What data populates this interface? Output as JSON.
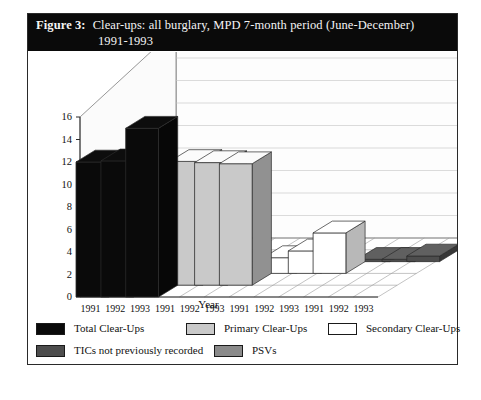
{
  "figure": {
    "label": "Figure 3:",
    "title_line1": "Clear-ups: all burglary, MPD 7-month period (June-December)",
    "title_line2": "1991-1993"
  },
  "chart_data": {
    "type": "bar",
    "title": "Number of Clear-Ups (Thousands)",
    "xlabel": "Year",
    "ylabel": "Number of Clear-Ups (Thousands)",
    "ylim": [
      0,
      16
    ],
    "yticks": [
      0,
      2,
      4,
      6,
      8,
      10,
      12,
      14,
      16
    ],
    "categories": [
      "1991",
      "1992",
      "1993"
    ],
    "xtick_labels": [
      "1991",
      "1992",
      "1993",
      "1991",
      "1992",
      "1993",
      "1991",
      "1992",
      "1993",
      "1991",
      "1992",
      "1993"
    ],
    "grid": true,
    "legend_position": "below",
    "projection": "3d-columns",
    "series": [
      {
        "name": "Total Clear-Ups",
        "color": "#0a0a0a",
        "values": [
          12.0,
          12.1,
          15.0
        ]
      },
      {
        "name": "Primary Clear-Ups",
        "color": "#c9c9c9",
        "values": [
          11.0,
          10.9,
          10.8
        ]
      },
      {
        "name": "Secondary Clear-Ups",
        "color": "#ffffff",
        "values": [
          1.4,
          2.0,
          3.6
        ]
      },
      {
        "name": "TICs not previously recorded",
        "color": "#4d4d4d",
        "values": [
          0.2,
          0.2,
          0.5
        ]
      },
      {
        "name": "PSVs",
        "color": "#8a8a8a",
        "values": [
          1.5,
          2.4,
          3.6
        ]
      }
    ]
  },
  "legend": {
    "entries": [
      {
        "label": "Total Clear-Ups",
        "color": "#0a0a0a"
      },
      {
        "label": "Primary Clear-Ups",
        "color": "#c9c9c9"
      },
      {
        "label": "Secondary Clear-Ups",
        "color": "#ffffff"
      },
      {
        "label": "TICs not previously recorded",
        "color": "#4d4d4d"
      },
      {
        "label": "PSVs",
        "color": "#8a8a8a"
      }
    ]
  }
}
